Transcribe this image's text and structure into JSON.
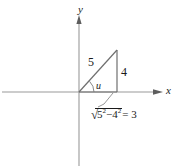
{
  "figure": {
    "kind": "right-triangle-in-coordinate-plane",
    "axes": {
      "y_label": "y",
      "x_label": "x"
    },
    "labels": {
      "hypotenuse": "5",
      "opposite": "4",
      "angle": "u",
      "base_expr_prefix": "",
      "base_radicand_a": "5",
      "base_radicand_a_exp": "2",
      "base_minus": "−",
      "base_radicand_b": "4",
      "base_radicand_b_exp": "2",
      "base_result": "= 3",
      "radical_sign": "√"
    },
    "colors": {
      "line": "#8a8a8a",
      "triangle": "#6f6f6f",
      "text": "#1a1a1a",
      "background": "#ffffff"
    },
    "geometry": {
      "origin_x": 79,
      "origin_y": 92,
      "apex_x": 117,
      "apex_y": 50,
      "foot_x": 117,
      "foot_y": 92,
      "x_axis_arrow_x": 160,
      "y_axis_arrow_y": 21
    }
  }
}
